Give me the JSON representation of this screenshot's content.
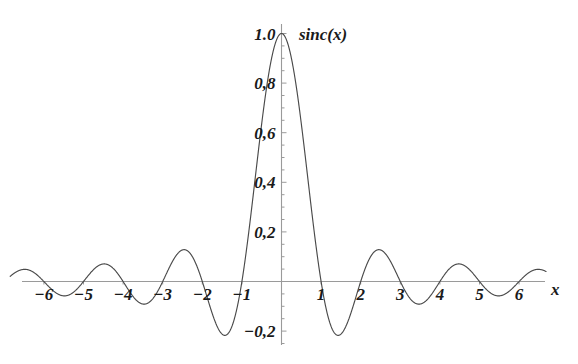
{
  "chart_data": {
    "type": "line",
    "title": "",
    "curve_label": "sinc(x)",
    "xlabel": "x",
    "ylabel": "",
    "function": "sinc(x) = sin(pi*x)/(pi*x)",
    "xlim": [
      -6.85,
      6.68
    ],
    "ylim": [
      -0.28,
      1.06
    ],
    "grid": false,
    "legend_position": "none",
    "x_ticks": [
      -6,
      -5,
      -4,
      -3,
      -2,
      -1,
      1,
      2,
      3,
      4,
      5,
      6
    ],
    "x_tick_labels": [
      "-6",
      "-5",
      "-4",
      "-3",
      "-2",
      "-1",
      "1",
      "2",
      "3",
      "4",
      "5",
      "6"
    ],
    "y_ticks": [
      1.0,
      0.8,
      0.6,
      0.4,
      0.2,
      -0.2
    ],
    "y_tick_labels": [
      "1.0",
      "0,8",
      "0,6",
      "0,4",
      "0,2",
      "-0,2"
    ],
    "y_minor_tick_step": 0.05,
    "key_points": {
      "peak": {
        "x": 0,
        "y": 1.0
      },
      "zeros": [
        -6,
        -5,
        -4,
        -3,
        -2,
        -1,
        1,
        2,
        3,
        4,
        5,
        6
      ],
      "minima": [
        {
          "x": -1.4303,
          "y": -0.2172
        },
        {
          "x": 1.4303,
          "y": -0.2172
        },
        {
          "x": -3.4709,
          "y": -0.0913
        },
        {
          "x": 3.4709,
          "y": -0.0913
        },
        {
          "x": -5.4818,
          "y": -0.0581
        },
        {
          "x": 5.4818,
          "y": -0.0581
        }
      ],
      "side_maxima": [
        {
          "x": -2.459,
          "y": 0.1284
        },
        {
          "x": 2.459,
          "y": 0.1284
        },
        {
          "x": -4.4747,
          "y": 0.0713
        },
        {
          "x": 4.4747,
          "y": 0.0713
        },
        {
          "x": -6.4844,
          "y": 0.0492
        },
        {
          "x": 6.4844,
          "y": 0.0492
        }
      ]
    },
    "colors": {
      "curve": "#4a4a4a",
      "axis": "#9a9a9a",
      "tick": "#9a9a9a",
      "text": "#1a1a1a",
      "background": "#ffffff"
    }
  }
}
